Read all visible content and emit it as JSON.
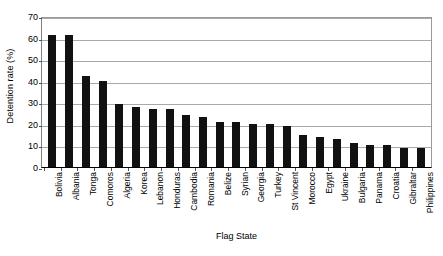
{
  "chart_data": {
    "type": "bar",
    "title": "",
    "xlabel": "Flag State",
    "ylabel": "Detention rate (%)",
    "ylim": [
      0,
      70
    ],
    "yticks": [
      0,
      10,
      20,
      30,
      40,
      50,
      60,
      70
    ],
    "grid": true,
    "legend": null,
    "bar_color": "#111111",
    "gridline_color": "#a9a9a9",
    "categories": [
      "Bolivia",
      "Albania",
      "Tonga",
      "Comoros",
      "Algeria",
      "Korea",
      "Lebanon",
      "Honduras",
      "Cambodia",
      "Romania",
      "Belize",
      "Syrian",
      "Georgia",
      "Turkey",
      "St Vincent",
      "Morocco",
      "Egypt",
      "Ukraine",
      "Bulgaria",
      "Panama",
      "Croatia",
      "Gibraltar",
      "Philippines"
    ],
    "values": [
      61,
      61,
      42,
      40,
      29,
      28,
      27,
      27,
      24,
      23,
      21,
      21,
      20,
      20,
      19,
      15,
      14,
      13,
      11,
      10,
      10,
      9,
      9
    ]
  }
}
